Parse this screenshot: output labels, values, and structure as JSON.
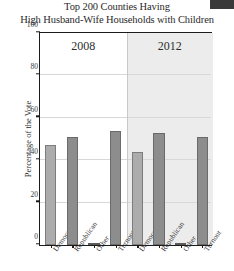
{
  "chart_data": {
    "type": "bar",
    "title": "Top 200 Counties Having High Husband-Wife Households with Children",
    "title_line1": "Top 200 Counties Having",
    "title_line2": "High Husband-Wife Households with Children",
    "xlabel": "",
    "ylabel": "Percentage of the Vote",
    "ylim": [
      0,
      100
    ],
    "yticks": [
      0,
      20,
      40,
      60,
      80,
      100
    ],
    "ytick_labels": [
      "0",
      "20",
      "40",
      "60",
      "80",
      "100"
    ],
    "grid": true,
    "legend": "none",
    "panels": [
      {
        "label": "2008",
        "categories": [
          "Democrat",
          "Republican",
          "Other",
          "Turnout"
        ],
        "values": [
          47,
          51,
          1,
          54
        ]
      },
      {
        "label": "2012",
        "categories": [
          "Democrat",
          "Republican",
          "Other",
          "Turnout"
        ],
        "values": [
          44,
          53,
          1,
          51
        ]
      }
    ],
    "categories": [
      "Democrat",
      "Republican",
      "Other",
      "Turnout"
    ],
    "series": [
      {
        "name": "2008",
        "values": [
          47,
          51,
          1,
          54
        ]
      },
      {
        "name": "2012",
        "values": [
          44,
          53,
          1,
          51
        ]
      }
    ],
    "colors": {
      "democrat": "#acacac",
      "republican": "#8d8d8d",
      "other": "#fdfdfd",
      "turnout": "#8d8d8d",
      "panel_2012_background": "#ececec",
      "axis": "#1b1b1b",
      "gridline": "#d8d8d8"
    }
  }
}
